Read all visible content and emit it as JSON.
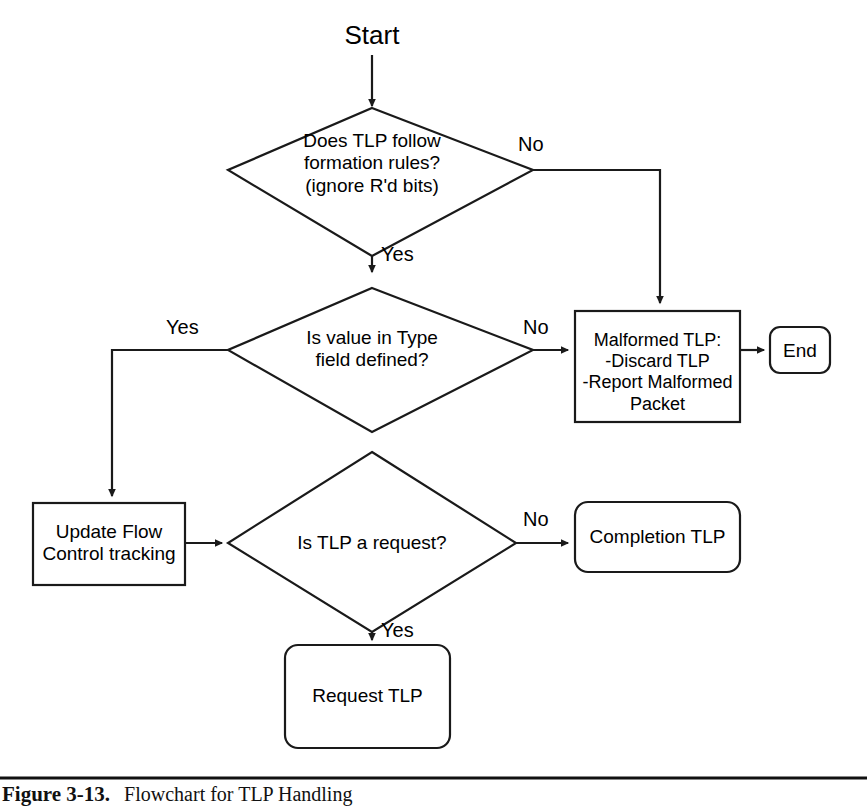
{
  "figure": {
    "caption_number": "Figure 3-13.",
    "caption_text": "Flowchart for TLP Handling"
  },
  "diagram": {
    "type": "flowchart",
    "nodes": [
      {
        "id": "start",
        "shape": "text",
        "label": "Start"
      },
      {
        "id": "decision-formation-rules",
        "shape": "diamond",
        "label": "Does TLP follow\nformation rules?\n(ignore R'd bits)"
      },
      {
        "id": "decision-type-field",
        "shape": "diamond",
        "label": "Is value in Type\nfield defined?"
      },
      {
        "id": "malformed-tlp",
        "shape": "rectangle",
        "label": "Malformed TLP:\n-Discard TLP\n-Report Malformed\nPacket"
      },
      {
        "id": "end",
        "shape": "rounded-rectangle",
        "label": "End"
      },
      {
        "id": "update-flow-control",
        "shape": "rectangle",
        "label": "Update Flow\nControl tracking"
      },
      {
        "id": "decision-is-request",
        "shape": "diamond",
        "label": "Is TLP a request?"
      },
      {
        "id": "completion-tlp",
        "shape": "rounded-rectangle",
        "label": "Completion TLP"
      },
      {
        "id": "request-tlp",
        "shape": "rounded-rectangle",
        "label": "Request TLP"
      }
    ],
    "edges": [
      {
        "id": "e-start-formation",
        "from": "start",
        "to": "decision-formation-rules",
        "label": ""
      },
      {
        "id": "e-formation-no",
        "from": "decision-formation-rules",
        "to": "malformed-tlp",
        "label": "No"
      },
      {
        "id": "e-formation-yes",
        "from": "decision-formation-rules",
        "to": "decision-type-field",
        "label": "Yes"
      },
      {
        "id": "e-type-no",
        "from": "decision-type-field",
        "to": "malformed-tlp",
        "label": "No"
      },
      {
        "id": "e-type-yes",
        "from": "decision-type-field",
        "to": "update-flow-control",
        "label": "Yes"
      },
      {
        "id": "e-malformed-end",
        "from": "malformed-tlp",
        "to": "end",
        "label": ""
      },
      {
        "id": "e-flow-request",
        "from": "update-flow-control",
        "to": "decision-is-request",
        "label": ""
      },
      {
        "id": "e-request-no",
        "from": "decision-is-request",
        "to": "completion-tlp",
        "label": "No"
      },
      {
        "id": "e-request-yes",
        "from": "decision-is-request",
        "to": "request-tlp",
        "label": "Yes"
      }
    ],
    "colors": {
      "stroke": "#1a1a1a",
      "fill": "#ffffff",
      "text": "#000000"
    }
  }
}
